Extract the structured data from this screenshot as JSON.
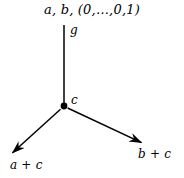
{
  "figure": {
    "type": "vector-tree-diagram",
    "background_color": "#ffffff",
    "stroke_color": "#000000",
    "labels": {
      "top": "a, b, (0,…,0,1)",
      "vertical_edge": "g",
      "vertex": "c",
      "left_arrow": "a + c",
      "right_arrow": "b + c"
    },
    "geometry": {
      "vertex": {
        "x": 64,
        "y": 106,
        "radius": 3.4
      },
      "edges": [
        {
          "name": "vertical-edge",
          "from": [
            64,
            106
          ],
          "to": [
            64,
            25
          ],
          "arrow": false
        },
        {
          "name": "left-arrow",
          "from": [
            64,
            106
          ],
          "to": [
            9,
            156
          ],
          "arrow": true
        },
        {
          "name": "right-arrow",
          "from": [
            64,
            106
          ],
          "to": [
            145,
            144
          ],
          "arrow": true
        }
      ]
    }
  }
}
